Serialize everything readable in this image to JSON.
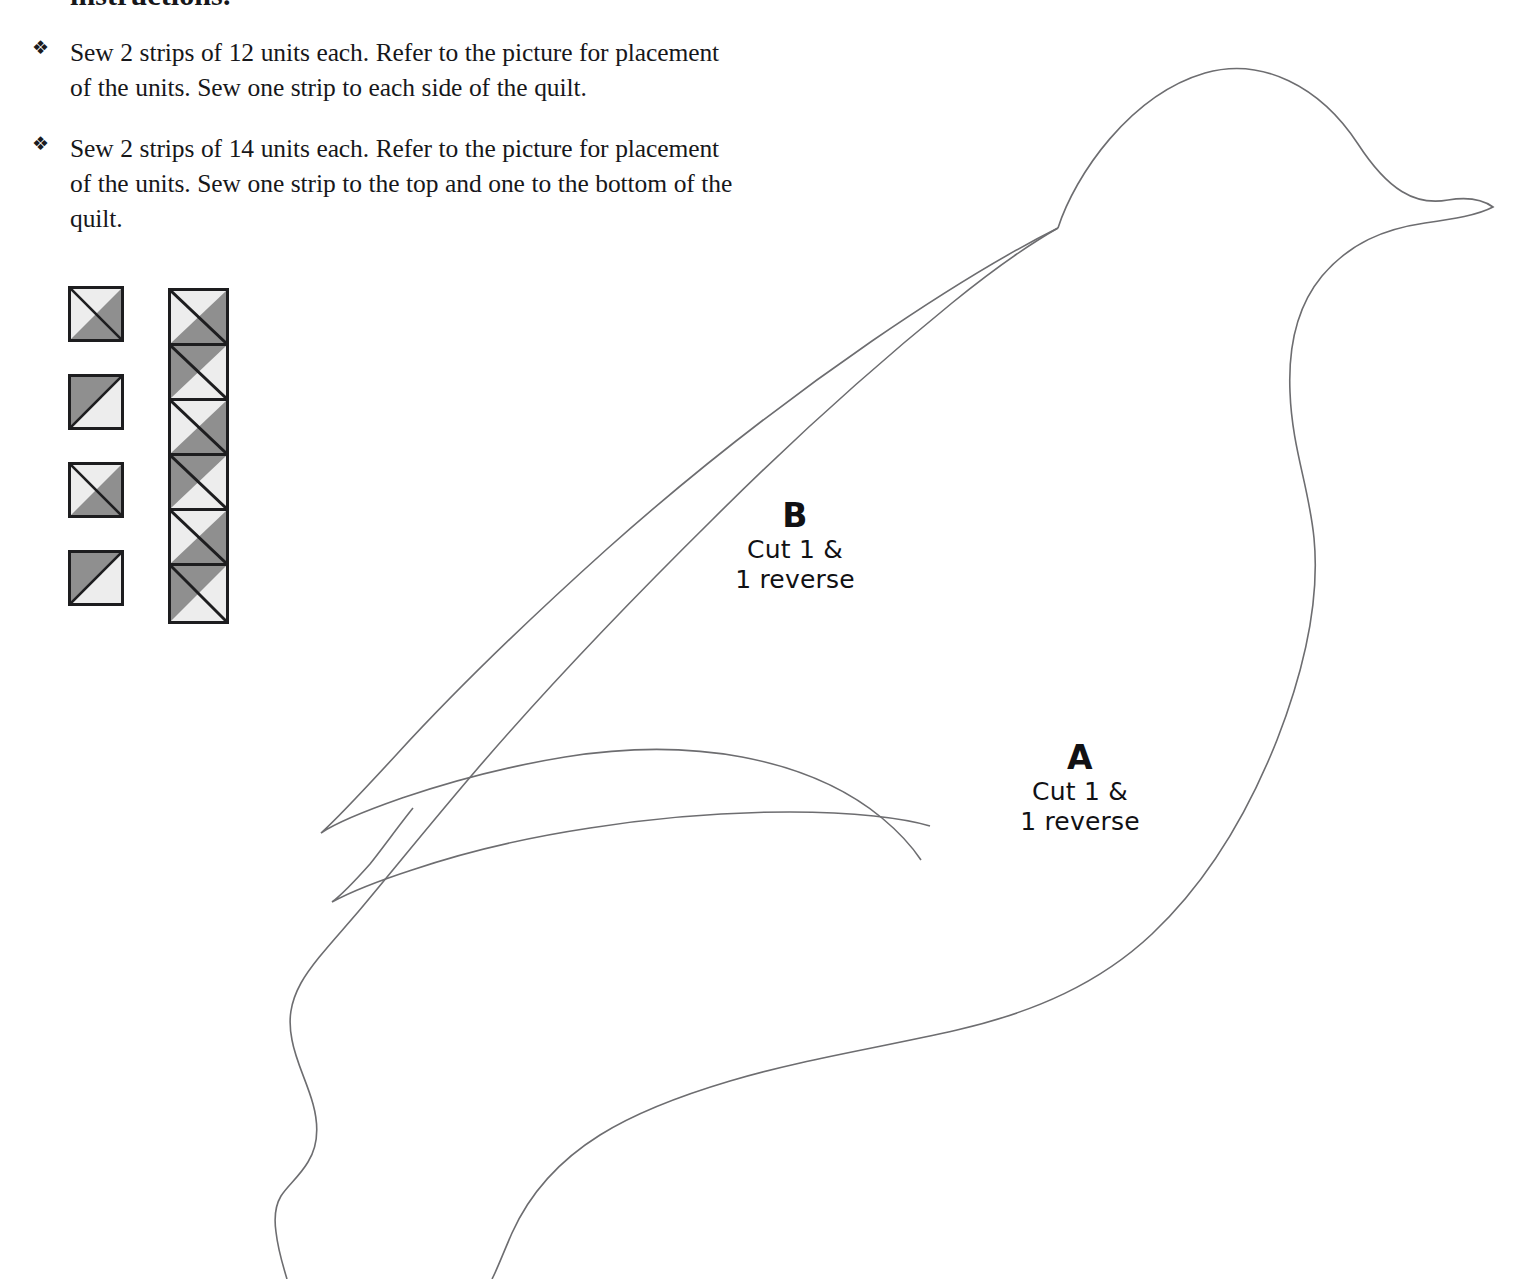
{
  "page": {
    "cutoff_heading": "instructions.",
    "width": 1524,
    "height": 1279,
    "background_color": "#ffffff"
  },
  "instructions": {
    "bullet_glyph": "❖",
    "items": [
      {
        "text": "Sew 2 strips of 12 units each. Refer to the picture for placement of the units. Sew one strip to each side of the quilt."
      },
      {
        "text": "Sew 2 strips of 14 units each. Refer to the picture for placement of the units. Sew one strip to the top and one to the bottom of the quilt."
      }
    ]
  },
  "quilt_units": {
    "colors": {
      "light": "#ededed",
      "dark": "#8f8f8f",
      "outline": "#1d1d1f"
    },
    "single_units": [
      {
        "name": "unit-1",
        "light_corner": "top-left",
        "dark_corner": "bottom-right"
      },
      {
        "name": "unit-2",
        "light_corner": "bottom-right",
        "dark_corner": "top-left"
      },
      {
        "name": "unit-3",
        "light_corner": "top-left",
        "dark_corner": "bottom-right"
      },
      {
        "name": "unit-4",
        "light_corner": "bottom-right",
        "dark_corner": "top-left"
      }
    ],
    "strip_cells": [
      {
        "name": "strip-cell-1",
        "light_corner": "top-left",
        "dark_corner": "bottom-right"
      },
      {
        "name": "strip-cell-2",
        "light_corner": "bottom-right",
        "dark_corner": "top-left"
      },
      {
        "name": "strip-cell-3",
        "light_corner": "top-left",
        "dark_corner": "bottom-right"
      },
      {
        "name": "strip-cell-4",
        "light_corner": "bottom-right",
        "dark_corner": "top-left"
      },
      {
        "name": "strip-cell-5",
        "light_corner": "top-left",
        "dark_corner": "bottom-right"
      },
      {
        "name": "strip-cell-6",
        "light_corner": "bottom-right",
        "dark_corner": "top-left"
      }
    ],
    "strip_cell_count": 6
  },
  "template_pieces": {
    "outline_color": "#6d6d70",
    "piece_b": {
      "letter": "B",
      "cut_line_1": "Cut 1 &",
      "cut_line_2": "1 reverse"
    },
    "piece_a": {
      "letter": "A",
      "cut_line_1": "Cut 1 &",
      "cut_line_2": "1 reverse"
    }
  }
}
